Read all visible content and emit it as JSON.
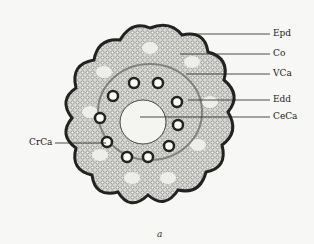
{
  "figure": {
    "caption": "a",
    "labels": [
      {
        "id": "epd",
        "text": "Epd"
      },
      {
        "id": "co",
        "text": "Co"
      },
      {
        "id": "vca",
        "text": "VCa"
      },
      {
        "id": "edd",
        "text": "Edd"
      },
      {
        "id": "ceca",
        "text": "CeCa"
      },
      {
        "id": "crca",
        "text": "CrCa"
      }
    ],
    "colors": {
      "tissue_dark": "#2a2a2a",
      "tissue_mid": "#8a8a8a",
      "background": "#f7f7f5"
    }
  }
}
